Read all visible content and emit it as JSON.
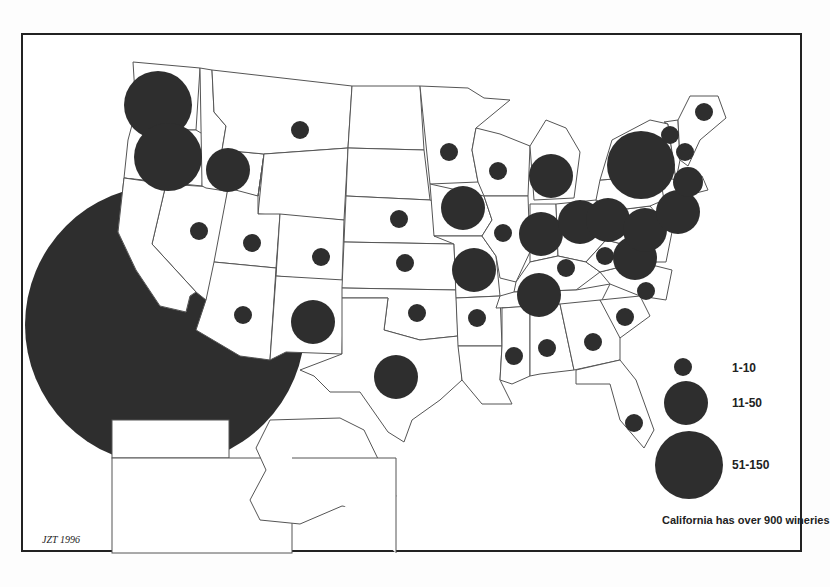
{
  "map": {
    "title": "",
    "credit": "JZT 1996",
    "caption": "California has over 900 wineries",
    "bubble_color": "#2e2e2e",
    "legend": {
      "items": [
        {
          "label": "1-10",
          "r": 9,
          "cx": 683,
          "cy": 367,
          "ly": 372
        },
        {
          "label": "11-50",
          "r": 22,
          "cx": 686,
          "cy": 403,
          "ly": 407
        },
        {
          "label": "51-150",
          "r": 34,
          "cx": 689,
          "cy": 465,
          "ly": 469
        }
      ]
    }
  },
  "chart_data": {
    "type": "proportional-symbol-map",
    "title": "",
    "subtitle": "Wineries by U.S. state",
    "legend": [
      "1-10",
      "11-50",
      "51-150"
    ],
    "annotation": "California has over 900 wineries",
    "credit": "JZT 1996",
    "states": [
      {
        "state": "California",
        "class": ">900",
        "cx": 165,
        "cy": 325,
        "r": 140
      },
      {
        "state": "Washington",
        "class": "51-150",
        "cx": 158,
        "cy": 105,
        "r": 34
      },
      {
        "state": "Oregon",
        "class": "51-150",
        "cx": 168,
        "cy": 157,
        "r": 34
      },
      {
        "state": "Idaho",
        "class": "11-50",
        "cx": 228,
        "cy": 170,
        "r": 22
      },
      {
        "state": "Montana",
        "class": "1-10",
        "cx": 300,
        "cy": 130,
        "r": 9
      },
      {
        "state": "Nevada",
        "class": "1-10",
        "cx": 199,
        "cy": 231,
        "r": 9
      },
      {
        "state": "Utah",
        "class": "1-10",
        "cx": 252,
        "cy": 243,
        "r": 9
      },
      {
        "state": "Colorado",
        "class": "1-10",
        "cx": 321,
        "cy": 257,
        "r": 9
      },
      {
        "state": "Arizona",
        "class": "1-10",
        "cx": 243,
        "cy": 315,
        "r": 9
      },
      {
        "state": "New Mexico",
        "class": "11-50",
        "cx": 313,
        "cy": 322,
        "r": 22
      },
      {
        "state": "Texas",
        "class": "11-50",
        "cx": 396,
        "cy": 377,
        "r": 22
      },
      {
        "state": "Oklahoma",
        "class": "1-10",
        "cx": 417,
        "cy": 313,
        "r": 9
      },
      {
        "state": "Kansas",
        "class": "1-10",
        "cx": 405,
        "cy": 263,
        "r": 9
      },
      {
        "state": "Nebraska",
        "class": "1-10",
        "cx": 399,
        "cy": 219,
        "r": 9
      },
      {
        "state": "Minnesota",
        "class": "1-10",
        "cx": 449,
        "cy": 152,
        "r": 9
      },
      {
        "state": "Wisconsin",
        "class": "1-10",
        "cx": 498,
        "cy": 171,
        "r": 9
      },
      {
        "state": "Iowa",
        "class": "11-50",
        "cx": 463,
        "cy": 208,
        "r": 22
      },
      {
        "state": "Missouri",
        "class": "11-50",
        "cx": 474,
        "cy": 270,
        "r": 22
      },
      {
        "state": "Illinois",
        "class": "1-10",
        "cx": 503,
        "cy": 233,
        "r": 9
      },
      {
        "state": "Arkansas",
        "class": "1-10",
        "cx": 477,
        "cy": 318,
        "r": 9
      },
      {
        "state": "Michigan",
        "class": "11-50",
        "cx": 551,
        "cy": 176,
        "r": 22
      },
      {
        "state": "Indiana",
        "class": "11-50",
        "cx": 541,
        "cy": 234,
        "r": 22
      },
      {
        "state": "Ohio",
        "class": "11-50",
        "cx": 580,
        "cy": 222,
        "r": 22
      },
      {
        "state": "Kentucky",
        "class": "1-10",
        "cx": 566,
        "cy": 268,
        "r": 9
      },
      {
        "state": "Tennessee",
        "class": "11-50",
        "cx": 539,
        "cy": 295,
        "r": 22
      },
      {
        "state": "Mississippi",
        "class": "1-10",
        "cx": 514,
        "cy": 356,
        "r": 9
      },
      {
        "state": "Alabama",
        "class": "1-10",
        "cx": 547,
        "cy": 348,
        "r": 9
      },
      {
        "state": "Georgia",
        "class": "1-10",
        "cx": 593,
        "cy": 342,
        "r": 9
      },
      {
        "state": "Florida",
        "class": "1-10",
        "cx": 634,
        "cy": 423,
        "r": 9
      },
      {
        "state": "South Carolina",
        "class": "1-10",
        "cx": 625,
        "cy": 317,
        "r": 9
      },
      {
        "state": "North Carolina",
        "class": "1-10",
        "cx": 646,
        "cy": 291,
        "r": 9
      },
      {
        "state": "Virginia",
        "class": "11-50",
        "cx": 635,
        "cy": 258,
        "r": 22
      },
      {
        "state": "West Virginia",
        "class": "1-10",
        "cx": 605,
        "cy": 256,
        "r": 9
      },
      {
        "state": "Pennsylvania",
        "class": "11-50",
        "cx": 608,
        "cy": 220,
        "r": 22
      },
      {
        "state": "Maryland",
        "class": "11-50",
        "cx": 645,
        "cy": 230,
        "r": 22
      },
      {
        "state": "New Jersey",
        "class": "11-50",
        "cx": 678,
        "cy": 212,
        "r": 22
      },
      {
        "state": "New York",
        "class": "51-150",
        "cx": 641,
        "cy": 165,
        "r": 34
      },
      {
        "state": "Connecticut/RI/MA",
        "class": "11-50",
        "cx": 688,
        "cy": 182,
        "r": 15
      },
      {
        "state": "Vermont",
        "class": "1-10",
        "cx": 670,
        "cy": 135,
        "r": 9
      },
      {
        "state": "New Hampshire",
        "class": "1-10",
        "cx": 685,
        "cy": 152,
        "r": 9
      },
      {
        "state": "Maine",
        "class": "1-10",
        "cx": 704,
        "cy": 112,
        "r": 9
      }
    ]
  }
}
